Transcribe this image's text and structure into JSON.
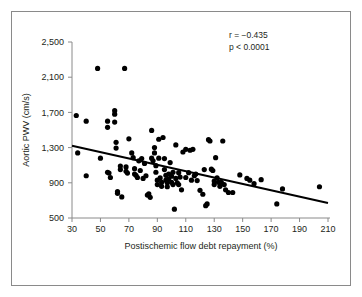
{
  "figure": {
    "border_color": "#8a8a8a",
    "background": "#ffffff"
  },
  "chart_data": {
    "type": "scatter",
    "title": "",
    "xlabel": "Postischemic flow debt repayment (%)",
    "ylabel": "Aortic PWV (cm/s)",
    "xlim": [
      30,
      210
    ],
    "ylim": [
      500,
      2500
    ],
    "xticks": [
      30,
      50,
      70,
      90,
      110,
      130,
      150,
      170,
      190,
      210
    ],
    "xticklabels": [
      "30",
      "50",
      "70",
      "90",
      "110",
      "130",
      "150",
      "170",
      "190",
      "210"
    ],
    "yticks": [
      500,
      900,
      1300,
      1700,
      2100,
      2500
    ],
    "yticklabels": [
      "500",
      "900",
      "1,300",
      "1,700",
      "2,100",
      "2,500"
    ],
    "grid": false,
    "legend": null,
    "marker_color": "#000000",
    "marker_size": 5.2,
    "annotations": [
      {
        "name": "correlation",
        "text": "r = −0.435",
        "x": 148,
        "y": 2430
      },
      {
        "name": "pvalue",
        "text": "p < 0.0001",
        "x": 148,
        "y": 2300
      }
    ],
    "trendline": {
      "name": "regression-line",
      "x": [
        30,
        210
      ],
      "y": [
        1320,
        670
      ],
      "color": "#000000",
      "width": 2.0
    },
    "points": [
      [
        33,
        1665
      ],
      [
        34,
        1240
      ],
      [
        40,
        1600
      ],
      [
        40,
        980
      ],
      [
        48,
        2200
      ],
      [
        50,
        1180
      ],
      [
        55,
        1600
      ],
      [
        55,
        1530
      ],
      [
        55,
        1020
      ],
      [
        56,
        1010
      ],
      [
        57,
        960
      ],
      [
        60,
        1720
      ],
      [
        60,
        1680
      ],
      [
        60,
        1590
      ],
      [
        61,
        1360
      ],
      [
        61,
        1295
      ],
      [
        62,
        800
      ],
      [
        62,
        780
      ],
      [
        64,
        1090
      ],
      [
        64,
        1050
      ],
      [
        65,
        740
      ],
      [
        67,
        2200
      ],
      [
        68,
        1080
      ],
      [
        68,
        1030
      ],
      [
        69,
        1010
      ],
      [
        70,
        1400
      ],
      [
        72,
        1240
      ],
      [
        73,
        1185
      ],
      [
        74,
        1060
      ],
      [
        74,
        1000
      ],
      [
        75,
        985
      ],
      [
        76,
        960
      ],
      [
        77,
        1150
      ],
      [
        78,
        1040
      ],
      [
        79,
        1175
      ],
      [
        80,
        950
      ],
      [
        81,
        1120
      ],
      [
        82,
        980
      ],
      [
        83,
        760
      ],
      [
        84,
        775
      ],
      [
        85,
        735
      ],
      [
        86,
        1495
      ],
      [
        86,
        1180
      ],
      [
        87,
        1150
      ],
      [
        88,
        1300
      ],
      [
        88,
        1240
      ],
      [
        89,
        1095
      ],
      [
        89,
        1020
      ],
      [
        90,
        930
      ],
      [
        90,
        880
      ],
      [
        91,
        1395
      ],
      [
        91,
        1180
      ],
      [
        92,
        955
      ],
      [
        93,
        905
      ],
      [
        93,
        860
      ],
      [
        94,
        1415
      ],
      [
        95,
        1175
      ],
      [
        95,
        1050
      ],
      [
        96,
        985
      ],
      [
        96,
        930
      ],
      [
        97,
        900
      ],
      [
        97,
        855
      ],
      [
        98,
        1000
      ],
      [
        98,
        945
      ],
      [
        99,
        1130
      ],
      [
        100,
        975
      ],
      [
        100,
        905
      ],
      [
        101,
        1020
      ],
      [
        101,
        880
      ],
      [
        102,
        600
      ],
      [
        103,
        1330
      ],
      [
        103,
        950
      ],
      [
        104,
        900
      ],
      [
        105,
        1015
      ],
      [
        105,
        880
      ],
      [
        106,
        965
      ],
      [
        107,
        820
      ],
      [
        108,
        1250
      ],
      [
        110,
        1280
      ],
      [
        110,
        960
      ],
      [
        112,
        1015
      ],
      [
        113,
        1270
      ],
      [
        114,
        930
      ],
      [
        115,
        1280
      ],
      [
        116,
        980
      ],
      [
        117,
        1000
      ],
      [
        118,
        925
      ],
      [
        120,
        815
      ],
      [
        122,
        770
      ],
      [
        123,
        1050
      ],
      [
        124,
        640
      ],
      [
        125,
        660
      ],
      [
        126,
        1390
      ],
      [
        127,
        1375
      ],
      [
        128,
        1055
      ],
      [
        129,
        1040
      ],
      [
        130,
        920
      ],
      [
        130,
        880
      ],
      [
        131,
        1185
      ],
      [
        132,
        955
      ],
      [
        133,
        905
      ],
      [
        134,
        860
      ],
      [
        135,
        905
      ],
      [
        136,
        1375
      ],
      [
        137,
        880
      ],
      [
        138,
        820
      ],
      [
        140,
        790
      ],
      [
        143,
        790
      ],
      [
        148,
        990
      ],
      [
        153,
        950
      ],
      [
        155,
        930
      ],
      [
        158,
        890
      ],
      [
        163,
        935
      ],
      [
        174,
        660
      ],
      [
        178,
        830
      ],
      [
        204,
        855
      ]
    ]
  },
  "axis_geometry": {
    "plot_left_px": 72,
    "plot_right_px": 328,
    "plot_top_px": 42,
    "plot_bottom_px": 218
  }
}
